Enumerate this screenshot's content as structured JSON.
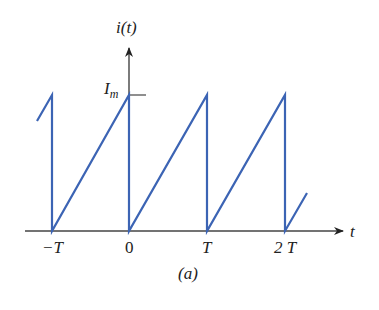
{
  "figure": {
    "y_axis_label": "i(t)",
    "x_axis_label": "t",
    "peak_label_main": "I",
    "peak_label_sub": "m",
    "caption": "(a)",
    "x_ticks": [
      "−T",
      "0",
      "T",
      "2 T"
    ]
  },
  "colors": {
    "waveform": "#3c64b4",
    "axis": "#333333",
    "background": "#ffffff"
  },
  "waveform": {
    "type": "sawtooth",
    "description": "Periodic ramp rising linearly from 0 to Im over each period T, then dropping instantly to 0",
    "period": "T",
    "amplitude": "Im",
    "peaks_at": [
      "-T",
      "0",
      "T",
      "2T"
    ]
  }
}
